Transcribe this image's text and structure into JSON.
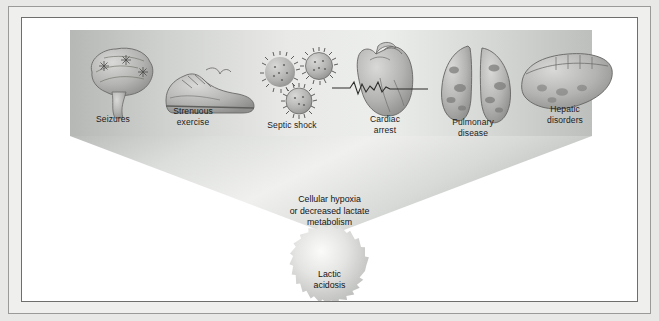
{
  "diagram": {
    "causes": [
      {
        "id": "seizures",
        "label": "Seizures",
        "icon": "brain-icon"
      },
      {
        "id": "strenuous-exercise",
        "label": "Strenuous\nexercise",
        "icon": "running-shoe-icon"
      },
      {
        "id": "septic-shock",
        "label": "Septic shock",
        "icon": "bacteria-icon"
      },
      {
        "id": "cardiac-arrest",
        "label": "Cardiac\narrest",
        "icon": "heart-ecg-icon"
      },
      {
        "id": "pulmonary-disease",
        "label": "Pulmonary\ndisease",
        "icon": "lungs-icon"
      },
      {
        "id": "hepatic-disorders",
        "label": "Hepatic\ndisorders",
        "icon": "liver-icon"
      }
    ],
    "mechanism": "Cellular hypoxia\nor decreased lactate\nmetabolism",
    "outcome": "Lactic\nacidosis",
    "colors": {
      "funnel_light": "#f4f4f2",
      "funnel_mid": "#d2d4d2",
      "funnel_dark": "#b4b6b4",
      "burst_fill": "#dcdcda",
      "frame_border": "#6e6e6c",
      "page_background": "#e8e8e6",
      "text": "#141414"
    }
  }
}
